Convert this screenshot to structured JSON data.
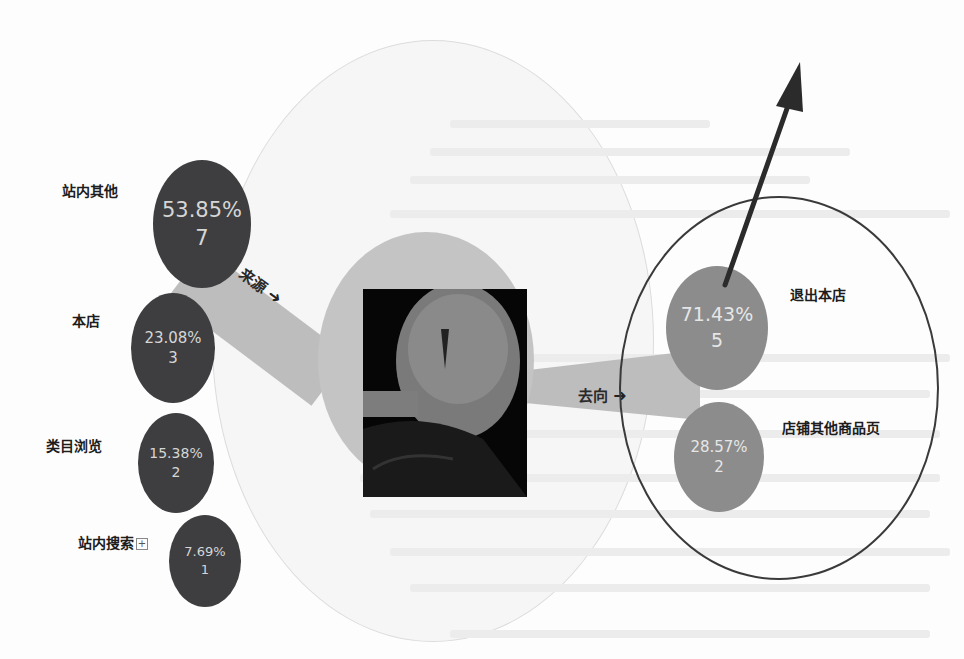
{
  "diagram": {
    "type": "traffic-flow",
    "center": {
      "image": "product-photo",
      "description": "product thumbnail"
    },
    "sources_label": "来源",
    "destinations_label": "去向",
    "sources": [
      {
        "name": "站内其他",
        "percent": "53.85%",
        "count": "7"
      },
      {
        "name": "本店",
        "percent": "23.08%",
        "count": "3"
      },
      {
        "name": "类目浏览",
        "percent": "15.38%",
        "count": "2"
      },
      {
        "name": "站内搜索",
        "percent": "7.69%",
        "count": "1",
        "expand_icon": "+"
      }
    ],
    "destinations": [
      {
        "name": "退出本店",
        "percent": "71.43%",
        "count": "5"
      },
      {
        "name": "店铺其他商品页",
        "percent": "28.57%",
        "count": "2"
      }
    ],
    "annotations": {
      "highlight_ring": "circle around destinations",
      "pointer_arrow": "arrow pointing up-right from 退出本店 node"
    },
    "colors": {
      "source_node": "#3e3e40",
      "destination_node": "#8c8c8c",
      "band": "#bdbdbd",
      "center_disc": "#c4c4c4",
      "ring": "#3a3a3a"
    }
  }
}
